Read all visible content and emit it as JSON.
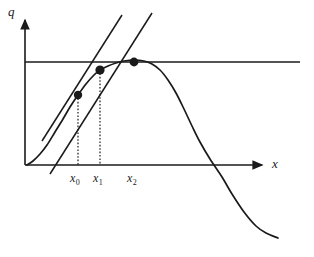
{
  "figure": {
    "kind": "newton-method-diagram",
    "background_color": "#ffffff",
    "stroke_color": "#1a1a1a"
  },
  "axes": {
    "y_axis_label": "q",
    "x_axis_label": "x",
    "origin": {
      "x": 25,
      "y": 165
    },
    "x_axis_end": {
      "x": 266,
      "y": 165
    },
    "y_axis_top": {
      "x": 25,
      "y": 16
    }
  },
  "ticks": {
    "items": [
      {
        "name": "x0",
        "label": "x",
        "sub": "0",
        "x": 78
      },
      {
        "name": "x1",
        "label": "x",
        "sub": "1",
        "x": 100
      },
      {
        "name": "x2",
        "label": "x",
        "sub": "2",
        "x": 134
      }
    ]
  },
  "chart_data": {
    "type": "line",
    "title": "",
    "xlabel": "x",
    "ylabel": "q",
    "grid": false,
    "legend": false,
    "asymptote_line": {
      "name": "horizontal-maximum-line",
      "y_pixel": 62,
      "x_start_pixel": 25,
      "x_end_pixel": 300
    },
    "curve": {
      "name": "objective-curve",
      "description": "smooth unimodal curve rising from origin, peaking near x2, then falling steeply and flattening",
      "points_pixel": [
        [
          27,
          165
        ],
        [
          33,
          161
        ],
        [
          40,
          154
        ],
        [
          47,
          145
        ],
        [
          55,
          132
        ],
        [
          63,
          119
        ],
        [
          70,
          107
        ],
        [
          78,
          95
        ],
        [
          86,
          84
        ],
        [
          94,
          75
        ],
        [
          100,
          70
        ],
        [
          108,
          66
        ],
        [
          116,
          63
        ],
        [
          124,
          61
        ],
        [
          134,
          60
        ],
        [
          144,
          61
        ],
        [
          152,
          64
        ],
        [
          160,
          70
        ],
        [
          168,
          80
        ],
        [
          176,
          93
        ],
        [
          184,
          109
        ],
        [
          192,
          126
        ],
        [
          200,
          142
        ],
        [
          210,
          159
        ],
        [
          222,
          177
        ],
        [
          232,
          194
        ],
        [
          244,
          212
        ],
        [
          256,
          226
        ],
        [
          266,
          233
        ],
        [
          278,
          238
        ]
      ]
    },
    "tangent_lines": [
      {
        "name": "tangent-at-x0",
        "from_pixel": [
          42,
          141
        ],
        "to_pixel": [
          122,
          15
        ],
        "touch_point_pixel": [
          78,
          95
        ]
      },
      {
        "name": "tangent-at-x1",
        "from_pixel": [
          50,
          174
        ],
        "to_pixel": [
          152,
          13
        ],
        "touch_point_pixel": [
          100,
          70
        ]
      }
    ],
    "points": [
      {
        "name": "point-x0",
        "x_pixel": 78,
        "y_pixel": 95,
        "label": "x0"
      },
      {
        "name": "point-x1",
        "x_pixel": 100,
        "y_pixel": 70,
        "label": "x1"
      },
      {
        "name": "point-x2",
        "x_pixel": 134,
        "y_pixel": 62,
        "label": "x2"
      }
    ],
    "drop_lines": [
      {
        "name": "dropline-x0",
        "x_pixel": 78,
        "y_top_pixel": 95,
        "y_bottom_pixel": 165
      },
      {
        "name": "dropline-x1",
        "x_pixel": 100,
        "y_top_pixel": 70,
        "y_bottom_pixel": 165
      }
    ]
  }
}
